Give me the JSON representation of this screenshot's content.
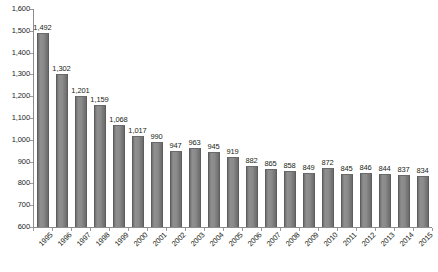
{
  "chart_data": {
    "type": "bar",
    "title": "",
    "subtitle": "",
    "xlabel": "",
    "ylabel": "",
    "ylim": [
      600,
      1600
    ],
    "ytick_step": 100,
    "grid": false,
    "legend": false,
    "legend_position": "none",
    "bar_color": "#808080",
    "axis_color": "#8c8c8c",
    "text_color": "#231f20",
    "categories": [
      "1995",
      "1996",
      "1997",
      "1998",
      "1999",
      "2000",
      "2001",
      "2002",
      "2003",
      "2004",
      "2005",
      "2006",
      "2007",
      "2008",
      "2009",
      "2010",
      "2011",
      "2012",
      "2013",
      "2014",
      "2015"
    ],
    "values": [
      1492,
      1302,
      1201,
      1159,
      1068,
      1017,
      990,
      947,
      963,
      945,
      919,
      882,
      865,
      858,
      849,
      872,
      845,
      846,
      844,
      837,
      834
    ],
    "data_labels": [
      "1,492",
      "1,302",
      "1,201",
      "1,159",
      "1,068",
      "1,017",
      "990",
      "947",
      "963",
      "945",
      "919",
      "882",
      "865",
      "858",
      "849",
      "872",
      "845",
      "846",
      "844",
      "837",
      "834"
    ],
    "ytick_labels": [
      "1,600",
      "1,500",
      "1,400",
      "1,300",
      "1,200",
      "1,100",
      "1,000",
      "900",
      "800",
      "700",
      "600"
    ],
    "ytick_values": [
      1600,
      1500,
      1400,
      1300,
      1200,
      1100,
      1000,
      900,
      800,
      700,
      600
    ]
  },
  "caption": {
    "text": ""
  }
}
